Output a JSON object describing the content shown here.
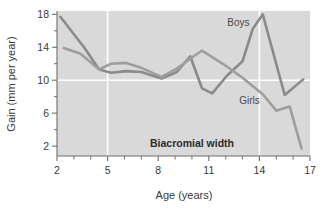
{
  "chart_data": {
    "type": "line",
    "title": "",
    "annotation": "Biacromial width",
    "xlabel": "Age (years)",
    "ylabel": "Gain (mm per year)",
    "xlim": [
      2,
      17
    ],
    "ylim": [
      0.8,
      18.4
    ],
    "xticks": [
      2,
      5,
      8,
      11,
      14,
      17
    ],
    "xticks_labels": [
      "2",
      "5",
      "8",
      "11",
      "14",
      "17"
    ],
    "xminorticks": [
      3,
      4,
      6,
      7,
      9,
      10,
      12,
      13,
      15,
      16
    ],
    "yticks": [
      2,
      6,
      10,
      14,
      18
    ],
    "yticks_labels": [
      "2",
      "6",
      "10",
      "14",
      "18"
    ],
    "yminorticks": [
      4,
      8,
      12,
      16
    ],
    "grid": "white gridlines at x=5, x=14 and y=10",
    "legend_position": "inline-labels",
    "plot_bgcolor": "#d9d9d9",
    "series": [
      {
        "name": "Boys",
        "color": "#8a8a8a",
        "label_x": 12.1,
        "label_y": 16.6,
        "x": [
          2.2,
          3.6,
          4.5,
          5.2,
          6.1,
          7.0,
          8.2,
          9.1,
          9.9,
          10.6,
          11.2,
          12.1,
          13.0,
          13.6,
          14.2,
          15.5,
          16.6
        ],
        "values": [
          17.7,
          14.0,
          11.3,
          10.9,
          11.1,
          11.0,
          10.2,
          11.0,
          12.9,
          9.0,
          8.4,
          10.6,
          12.3,
          16.2,
          18.0,
          8.2,
          10.1
        ]
      },
      {
        "name": "Girls",
        "color": "#9e9e9e",
        "label_x": 12.8,
        "label_y": 7.1,
        "x": [
          2.4,
          3.4,
          4.5,
          5.2,
          6.1,
          7.0,
          8.2,
          9.1,
          9.9,
          10.6,
          11.9,
          13.0,
          14.2,
          15.0,
          15.8,
          16.5
        ],
        "values": [
          13.9,
          13.2,
          11.3,
          12.0,
          12.1,
          11.5,
          10.4,
          11.4,
          12.6,
          13.6,
          11.9,
          10.3,
          8.3,
          6.3,
          6.8,
          1.7
        ]
      }
    ]
  },
  "axes": {
    "y_axis_title": "Gain (mm per year)",
    "x_axis_title": "Age (years)"
  },
  "labels": {
    "boys": "Boys",
    "girls": "Girls",
    "annotation": "Biacromial width"
  }
}
